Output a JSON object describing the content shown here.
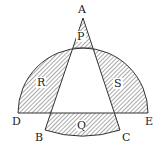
{
  "diagram": {
    "points": {
      "A": "A",
      "B": "B",
      "C": "C",
      "D": "D",
      "E": "E"
    },
    "regions": {
      "P": "P",
      "Q": "Q",
      "R": "R",
      "S": "S"
    },
    "shaded_regions": [
      "P",
      "Q",
      "R",
      "S"
    ],
    "colors": {
      "stroke": "#333333",
      "hatch": "#555555",
      "background": "#ffffff"
    }
  }
}
